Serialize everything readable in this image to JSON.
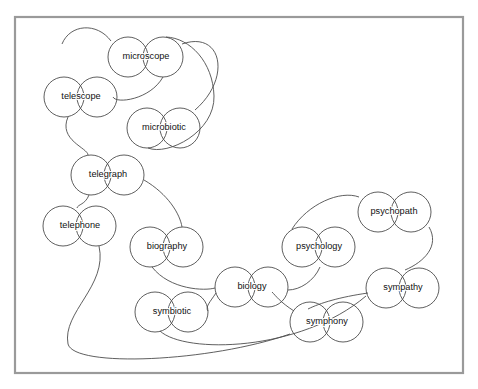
{
  "diagram": {
    "type": "node-link graph",
    "background_color": "#ffffff",
    "frame": {
      "stroke_color": "#9a9a9a",
      "x": 15,
      "y": 17,
      "width": 448,
      "height": 356
    },
    "style": {
      "node_stroke_color": "#4d4d4d",
      "node_fill_color": "#ffffff",
      "edge_stroke_color": "#4d4d4d",
      "label_color": "#111111",
      "node_radius": 20
    },
    "nodes": [
      {
        "id": "microscope",
        "label": "microscope",
        "left_circle": {
          "cx": 128,
          "cy": 57,
          "r": 20
        },
        "right_circle": {
          "cx": 163,
          "cy": 57,
          "r": 20
        },
        "label_x": 146,
        "label_y": 57
      },
      {
        "id": "telescope",
        "label": "telescope",
        "left_circle": {
          "cx": 64,
          "cy": 97,
          "r": 20
        },
        "right_circle": {
          "cx": 97,
          "cy": 97,
          "r": 20
        },
        "label_x": 81,
        "label_y": 97
      },
      {
        "id": "microbiotic",
        "label": "microbiotic",
        "left_circle": {
          "cx": 147,
          "cy": 128,
          "r": 20
        },
        "right_circle": {
          "cx": 180,
          "cy": 128,
          "r": 20
        },
        "label_x": 164,
        "label_y": 128
      },
      {
        "id": "telegraph",
        "label": "telegraph",
        "left_circle": {
          "cx": 91,
          "cy": 175,
          "r": 20
        },
        "right_circle": {
          "cx": 124,
          "cy": 175,
          "r": 20
        },
        "label_x": 108,
        "label_y": 175
      },
      {
        "id": "telephone",
        "label": "telephone",
        "left_circle": {
          "cx": 63,
          "cy": 226,
          "r": 20
        },
        "right_circle": {
          "cx": 96,
          "cy": 226,
          "r": 20
        },
        "label_x": 80,
        "label_y": 226
      },
      {
        "id": "biography",
        "label": "biography",
        "left_circle": {
          "cx": 150,
          "cy": 247,
          "r": 20
        },
        "right_circle": {
          "cx": 183,
          "cy": 247,
          "r": 20
        },
        "label_x": 167,
        "label_y": 247
      },
      {
        "id": "biology",
        "label": "biology",
        "left_circle": {
          "cx": 235,
          "cy": 287,
          "r": 20
        },
        "right_circle": {
          "cx": 268,
          "cy": 287,
          "r": 20
        },
        "label_x": 252,
        "label_y": 287
      },
      {
        "id": "symbiotic",
        "label": "symbiotic",
        "left_circle": {
          "cx": 155,
          "cy": 312,
          "r": 20
        },
        "right_circle": {
          "cx": 188,
          "cy": 312,
          "r": 20
        },
        "label_x": 172,
        "label_y": 312
      },
      {
        "id": "psychology",
        "label": "psychology",
        "left_circle": {
          "cx": 302,
          "cy": 247,
          "r": 20
        },
        "right_circle": {
          "cx": 335,
          "cy": 247,
          "r": 20
        },
        "label_x": 319,
        "label_y": 247
      },
      {
        "id": "psychopath",
        "label": "psychopath",
        "left_circle": {
          "cx": 378,
          "cy": 212,
          "r": 20
        },
        "right_circle": {
          "cx": 411,
          "cy": 212,
          "r": 20
        },
        "label_x": 394,
        "label_y": 212
      },
      {
        "id": "sympathy",
        "label": "sympathy",
        "left_circle": {
          "cx": 386,
          "cy": 288,
          "r": 20
        },
        "right_circle": {
          "cx": 419,
          "cy": 288,
          "r": 20
        },
        "label_x": 403,
        "label_y": 288
      },
      {
        "id": "symphony",
        "label": "symphony",
        "left_circle": {
          "cx": 310,
          "cy": 322,
          "r": 20
        },
        "right_circle": {
          "cx": 343,
          "cy": 322,
          "r": 20
        },
        "label_x": 327,
        "label_y": 322
      }
    ],
    "edges": [
      {
        "id": "microscope-telescope",
        "from": "microscope",
        "to": "telescope",
        "path": "M 111 41 C 97 22, 70 24, 62 44"
      },
      {
        "id": "microscope-telescope-scope",
        "from": "microscope",
        "to": "telescope",
        "path": "M 163 77 C 150 100, 116 104, 113 97"
      },
      {
        "id": "telescope-telegraph",
        "from": "telescope",
        "to": "telegraph",
        "path": "M 68 117 C 58 140, 88 148, 88 155"
      },
      {
        "id": "microscope-microbiotic",
        "from": "microscope",
        "to": "microbiotic",
        "path": "M 182 44 C 222 30, 232 78, 195 110"
      },
      {
        "id": "microbiotic-loop",
        "from": "microbiotic",
        "to": "microscope",
        "path": "M 148 148 C 168 156, 215 132, 214 96 C 213 62, 190 38, 166 37"
      },
      {
        "id": "telegraph-telephone",
        "from": "telegraph",
        "to": "telephone",
        "path": "M 89 195 C 85 205, 78 204, 77 208"
      },
      {
        "id": "telegraph-biography",
        "from": "telegraph",
        "to": "biography",
        "path": "M 144 180 C 168 194, 180 214, 182 227"
      },
      {
        "id": "biography-biology",
        "from": "biography",
        "to": "biology",
        "path": "M 152 267 C 170 290, 205 291, 215 288"
      },
      {
        "id": "biology-symbiotic",
        "from": "biology",
        "to": "symbiotic",
        "path": "M 216 293 C 210 302, 205 307, 208 311"
      },
      {
        "id": "telephone-symphony",
        "from": "telephone",
        "to": "symphony",
        "path": "M 99 246 C 108 286, 62 312, 68 344 C 74 368, 210 362, 290 334"
      },
      {
        "id": "symbiotic-sympathy",
        "from": "symbiotic",
        "to": "sympathy",
        "path": "M 160 331 C 185 354, 300 352, 366 296"
      },
      {
        "id": "biology-psychology",
        "from": "biology",
        "to": "psychology",
        "path": "M 288 290 C 300 290, 314 281, 320 267"
      },
      {
        "id": "psychology-psychopath",
        "from": "psychology",
        "to": "psychopath",
        "path": "M 292 229 C 308 204, 340 190, 359 197"
      },
      {
        "id": "psychopath-sympathy",
        "from": "psychopath",
        "to": "sympathy",
        "path": "M 429 227 C 440 246, 424 262, 405 270"
      },
      {
        "id": "sympathy-symphony",
        "from": "sympathy",
        "to": "symphony",
        "path": "M 368 293 C 340 297, 320 303, 308 309"
      },
      {
        "id": "symphony-biology",
        "from": "symphony",
        "to": "biology",
        "path": "M 294 311 C 280 302, 276 296, 272 292"
      }
    ]
  }
}
